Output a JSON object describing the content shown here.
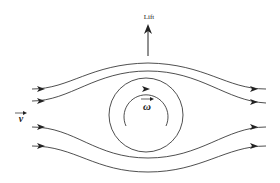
{
  "diagram": {
    "labels": {
      "lift": "Lift",
      "velocity": "v",
      "angular_velocity": "ω"
    },
    "streamlines_count": 4,
    "colors": {
      "stroke": "#222222",
      "background": "#ffffff"
    }
  }
}
